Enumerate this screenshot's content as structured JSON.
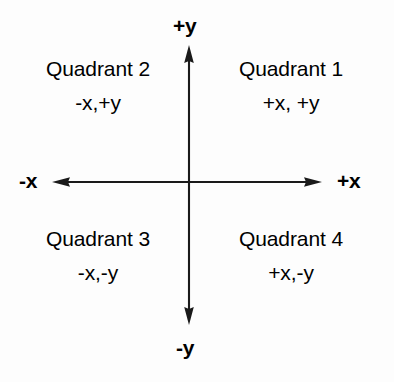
{
  "diagram": {
    "background_color": "#fdfdfd",
    "line_color": "#1a1a1a",
    "axes": {
      "labels": {
        "positive_y": "+y",
        "negative_y": "-y",
        "negative_x": "-x",
        "positive_x": "+x"
      },
      "origin": {
        "x": 189,
        "y": 182
      },
      "x_axis": {
        "start_x": 52,
        "end_x": 322,
        "y": 182
      },
      "y_axis": {
        "x": 189,
        "start_y": 45,
        "end_y": 325
      }
    },
    "quadrants": [
      {
        "id": "quadrant-1",
        "title": "Quadrant 1",
        "coords": "+x, +y",
        "position": "top-right"
      },
      {
        "id": "quadrant-2",
        "title": "Quadrant 2",
        "coords": "-x,+y",
        "position": "top-left"
      },
      {
        "id": "quadrant-3",
        "title": "Quadrant 3",
        "coords": "-x,-y",
        "position": "bottom-left"
      },
      {
        "id": "quadrant-4",
        "title": "Quadrant 4",
        "coords": "+x,-y",
        "position": "bottom-right"
      }
    ]
  }
}
